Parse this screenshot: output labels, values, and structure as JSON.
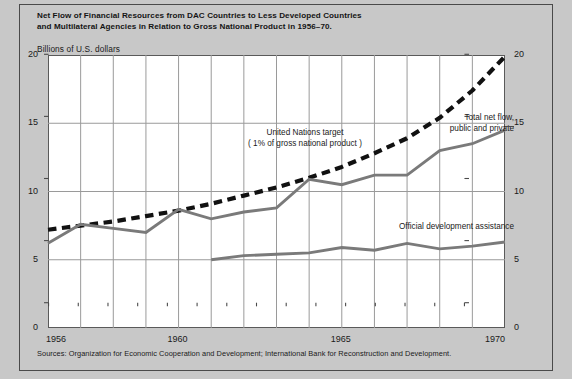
{
  "title": {
    "line1": "Net Flow of Financial Resources from DAC Countries to Less Developed Countries",
    "line2": "and Multilateral Agencies in Relation to Gross National Product in 1956–70."
  },
  "axis_unit_label": "Billions of U.S. dollars",
  "source_note": "Sources: Organization for Economic Cooperation and Development; International Bank for Reconstruction and Development.",
  "annotations": {
    "un_target_line1": "United Nations target",
    "un_target_line2": "( 1% of gross national product )",
    "total_net_flow_line1": "Total net flow,",
    "total_net_flow_line2": "public and private",
    "oda": "Official development assistance"
  },
  "colors": {
    "page_background": "#c8c8c8",
    "plot_background": "#ffffff",
    "grid": "#9a9a9a",
    "axis": "#4a4a4a",
    "series_gray": "#7a7a7a",
    "series_dashed": "#111111",
    "text": "#1a1a1a"
  },
  "chart_data": {
    "type": "line",
    "title": "Net Flow of Financial Resources from DAC Countries to Less Developed Countries and Multilateral Agencies in Relation to Gross National Product in 1956–70.",
    "xlabel": "",
    "ylabel": "Billions of U.S. dollars",
    "xlim": [
      1956,
      1970
    ],
    "ylim": [
      0,
      20
    ],
    "yticks": [
      0,
      5,
      10,
      15,
      20
    ],
    "ytick_labels": [
      "0",
      "5",
      "10",
      "15",
      "20"
    ],
    "xticks": [
      1956,
      1957,
      1958,
      1959,
      1960,
      1961,
      1962,
      1963,
      1964,
      1965,
      1966,
      1967,
      1968,
      1969,
      1970
    ],
    "xtick_labels_shown": [
      "1956",
      "1960",
      "1965",
      "1970"
    ],
    "xtick_labels_shown_at": [
      1956,
      1960,
      1965,
      1970
    ],
    "grid": "both",
    "legend": "inline-annotations",
    "dual_y_axis": true,
    "series": [
      {
        "name": "United Nations target ( 1% of gross national product )",
        "style": "dashed",
        "color": "#111111",
        "x": [
          1956,
          1957,
          1958,
          1959,
          1960,
          1961,
          1962,
          1963,
          1964,
          1965,
          1966,
          1967,
          1968,
          1969,
          1970
        ],
        "values": [
          7.2,
          7.5,
          7.8,
          8.2,
          8.6,
          9.1,
          9.7,
          10.3,
          11.0,
          11.8,
          12.8,
          13.9,
          15.4,
          17.4,
          19.9
        ]
      },
      {
        "name": "Total net flow, public and private",
        "style": "solid",
        "color": "#7a7a7a",
        "x": [
          1956,
          1957,
          1958,
          1959,
          1960,
          1961,
          1962,
          1963,
          1964,
          1965,
          1966,
          1967,
          1968,
          1969,
          1970
        ],
        "values": [
          6.2,
          7.6,
          7.3,
          7.0,
          8.7,
          8.0,
          8.5,
          8.8,
          10.9,
          10.5,
          11.2,
          11.2,
          13.0,
          13.5,
          14.5
        ]
      },
      {
        "name": "Official development assistance",
        "style": "solid",
        "color": "#7a7a7a",
        "x": [
          1961,
          1962,
          1963,
          1964,
          1965,
          1966,
          1967,
          1968,
          1969,
          1970
        ],
        "values": [
          5.0,
          5.3,
          5.4,
          5.5,
          5.9,
          5.7,
          6.2,
          5.8,
          6.0,
          6.3
        ]
      }
    ]
  }
}
